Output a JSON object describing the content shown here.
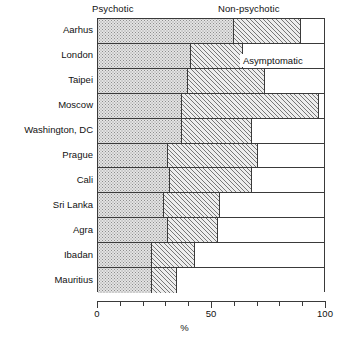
{
  "chart_data": {
    "type": "bar",
    "orientation": "horizontal",
    "stacked": true,
    "normalized_percent": true,
    "title": "",
    "subtitle": "",
    "xlabel": "%",
    "ylabel": "",
    "xlim": [
      0,
      100
    ],
    "xticks": [
      0,
      10,
      20,
      30,
      40,
      50,
      60,
      70,
      80,
      90,
      100
    ],
    "xtick_labels": {
      "0": "0",
      "50": "50",
      "100": "100"
    },
    "grid": false,
    "legend_position": "top-and-inline-annotation",
    "categories": [
      "Aarhus",
      "London",
      "Taipei",
      "Moscow",
      "Washington, DC",
      "Prague",
      "Cali",
      "Sri Lanka",
      "Agra",
      "Ibadan",
      "Mauritius"
    ],
    "series": [
      {
        "name": "Psychotic",
        "fill": "dotted",
        "values": [
          60,
          41,
          40,
          37,
          37,
          31,
          32,
          29,
          31,
          24,
          24
        ]
      },
      {
        "name": "Non-psychotic",
        "fill": "diagonal-hatch",
        "values": [
          30,
          23,
          34,
          61,
          31,
          40,
          36,
          25,
          22,
          19,
          11
        ]
      },
      {
        "name": "Asymptomatic",
        "fill": "white",
        "values": [
          10,
          36,
          26,
          2,
          32,
          29,
          32,
          46,
          47,
          57,
          65
        ]
      }
    ],
    "cumulative_boundaries": {
      "psychotic_end": [
        60,
        41,
        40,
        37,
        37,
        31,
        32,
        29,
        31,
        24,
        24
      ],
      "nonpsychotic_end": [
        90,
        64,
        74,
        98,
        68,
        71,
        68,
        54,
        53,
        43,
        35
      ]
    },
    "annotations": [
      {
        "text": "Asymptomatic",
        "row": "London",
        "placement": "inside-white-segment"
      }
    ],
    "colors": {
      "outline": "#3a3a3a",
      "psychotic_fill": "#e3e3e3",
      "psychotic_dots": "#8d8d8d",
      "nonpsychotic_fill": "#ededed",
      "nonpsychotic_hatch": "#777777",
      "asymptomatic_fill": "#ffffff",
      "text": "#111111"
    }
  },
  "headers": {
    "psychotic": "Psychotic",
    "non_psychotic": "Non-psychotic"
  },
  "axis": {
    "x_title": "%",
    "x_tick_0": "0",
    "x_tick_50": "50",
    "x_tick_100": "100"
  },
  "annotation": {
    "asymptomatic": "Asymptomatic"
  }
}
